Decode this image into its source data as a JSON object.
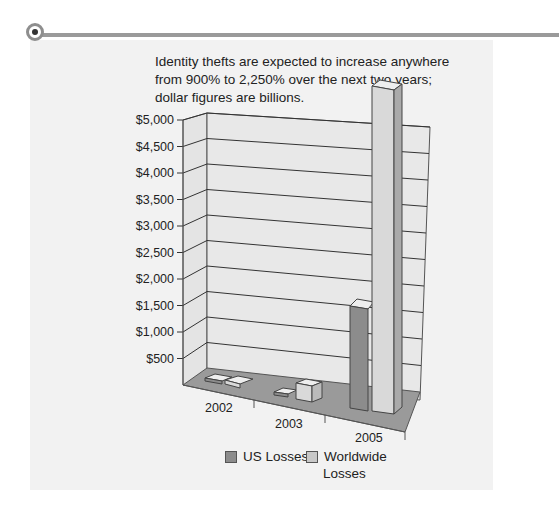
{
  "caption": "Identity thefts are expected to increase anywhere from 900% to 2,250% over the next two years; dollar figures are billions.",
  "chart_data": {
    "type": "bar",
    "style": "3d-clustered-column",
    "title": "Identity thefts are expected to increase anywhere from 900% to 2,250% over the next two years; dollar figures are billions.",
    "categories": [
      "2002",
      "2003",
      "2005"
    ],
    "series": [
      {
        "name": "US Losses",
        "values": [
          50,
          50,
          1600
        ],
        "color": "#8c8c8c"
      },
      {
        "name": "Worldwide Losses",
        "values": [
          50,
          200,
          4800
        ],
        "color": "#d9d9d9"
      }
    ],
    "xlabel": "",
    "ylabel": "",
    "ylim": [
      0,
      5000
    ],
    "yticks": [
      "$500",
      "$1,000",
      "$1,500",
      "$2,000",
      "$2,500",
      "$3,000",
      "$3,500",
      "$4,000",
      "$4,500",
      "$5,000"
    ],
    "grid": true,
    "legend_position": "bottom"
  },
  "legend": {
    "us": "US Losses",
    "worldwide_line1": "Worldwide",
    "worldwide_line2": "Losses"
  }
}
